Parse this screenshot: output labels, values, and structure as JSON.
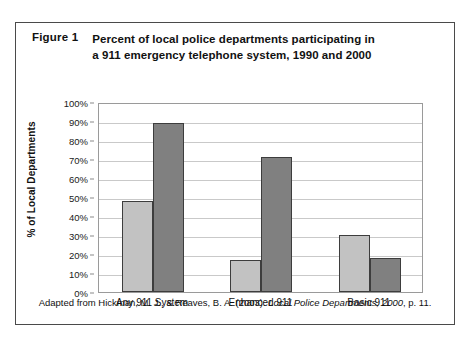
{
  "figure": {
    "label": "Figure 1",
    "title_line1": "Percent of local police departments participating in",
    "title_line2": "a 911 emergency telephone system, 1990 and 2000"
  },
  "footer": {
    "prefix": "Adapted from Hickman, M. J., & Reaves, B. A. (2003). ",
    "source_italic": "Local Police Departments, 2000",
    "suffix": ", p. 11."
  },
  "colors": {
    "series_1990": "#c2c2c2",
    "series_2000": "#808080",
    "bar_outline": "#3d3d3d",
    "gridline": "#c9c9c9",
    "frame": "#9a9a9a",
    "card_border": "#4a4a4a",
    "text": "#111111"
  },
  "chart_data": {
    "type": "bar",
    "title": "Percent of local police departments participating in a 911 emergency telephone system, 1990 and 2000",
    "xlabel": "",
    "ylabel": "% of Local Departments",
    "ylim": [
      0,
      100
    ],
    "ytick_labels": [
      "100%",
      "90%",
      "80%",
      "70%",
      "60%",
      "50%",
      "40%",
      "30%",
      "20%",
      "10%",
      "0%"
    ],
    "ytick_values": [
      100,
      90,
      80,
      70,
      60,
      50,
      40,
      30,
      20,
      10,
      0
    ],
    "grid": true,
    "legend_position": "none",
    "categories": [
      "Any 911 System",
      "Enhanced 911",
      "Basic 911"
    ],
    "series": [
      {
        "name": "1990",
        "values": [
          48,
          17,
          30
        ]
      },
      {
        "name": "2000",
        "values": [
          89,
          71,
          18
        ]
      }
    ]
  }
}
